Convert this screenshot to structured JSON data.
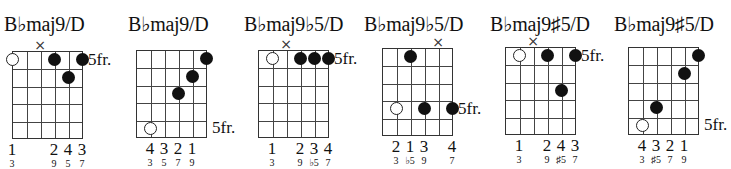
{
  "chart_data": {
    "type": "diagram",
    "chords": [
      {
        "name": "B♭maj9/D",
        "fret_label": "5fr.",
        "fret_label_row": 1,
        "muted_strings": [
          3
        ],
        "dots": [
          {
            "string": 1,
            "fret": 1,
            "open": true
          },
          {
            "string": 4,
            "fret": 1,
            "open": false
          },
          {
            "string": 6,
            "fret": 1,
            "open": false
          },
          {
            "string": 5,
            "fret": 2,
            "open": false
          }
        ],
        "fingers": [
          {
            "string": 1,
            "label": "1"
          },
          {
            "string": 4,
            "label": "2"
          },
          {
            "string": 5,
            "label": "4"
          },
          {
            "string": 6,
            "label": "3"
          }
        ],
        "intervals": [
          {
            "string": 1,
            "label": "3"
          },
          {
            "string": 4,
            "label": "9"
          },
          {
            "string": 5,
            "label": "5"
          },
          {
            "string": 6,
            "label": "7"
          }
        ]
      },
      {
        "name": "B♭maj9/D",
        "fret_label": "5fr.",
        "fret_label_row": 5,
        "muted_strings": [],
        "dots": [
          {
            "string": 6,
            "fret": 1,
            "open": false
          },
          {
            "string": 5,
            "fret": 2,
            "open": false
          },
          {
            "string": 4,
            "fret": 3,
            "open": false
          },
          {
            "string": 2,
            "fret": 5,
            "open": true
          }
        ],
        "fingers": [
          {
            "string": 2,
            "label": "4"
          },
          {
            "string": 3,
            "label": "3"
          },
          {
            "string": 4,
            "label": "2"
          },
          {
            "string": 5,
            "label": "1"
          }
        ],
        "intervals": [
          {
            "string": 2,
            "label": "3"
          },
          {
            "string": 3,
            "label": "5"
          },
          {
            "string": 4,
            "label": "7"
          },
          {
            "string": 5,
            "label": "9"
          }
        ]
      },
      {
        "name": "B♭maj9♭5/D",
        "fret_label": "5fr.",
        "fret_label_row": 1,
        "muted_strings": [
          3
        ],
        "dots": [
          {
            "string": 2,
            "fret": 1,
            "open": true
          },
          {
            "string": 4,
            "fret": 1,
            "open": false
          },
          {
            "string": 5,
            "fret": 1,
            "open": false
          },
          {
            "string": 6,
            "fret": 1,
            "open": false
          }
        ],
        "fingers": [
          {
            "string": 2,
            "label": "1"
          },
          {
            "string": 4,
            "label": "2"
          },
          {
            "string": 5,
            "label": "3"
          },
          {
            "string": 6,
            "label": "4"
          }
        ],
        "intervals": [
          {
            "string": 2,
            "label": "3"
          },
          {
            "string": 4,
            "label": "9"
          },
          {
            "string": 5,
            "label": "♭5"
          },
          {
            "string": 6,
            "label": "7"
          }
        ]
      },
      {
        "name": "B♭maj9♭5/D",
        "fret_label": "5fr.",
        "fret_label_row": 4,
        "muted_strings": [
          5
        ],
        "dots": [
          {
            "string": 3,
            "fret": 1,
            "open": false
          },
          {
            "string": 2,
            "fret": 4,
            "open": true
          },
          {
            "string": 4,
            "fret": 4,
            "open": false
          },
          {
            "string": 6,
            "fret": 4,
            "open": false
          }
        ],
        "fingers": [
          {
            "string": 2,
            "label": "2"
          },
          {
            "string": 3,
            "label": "1"
          },
          {
            "string": 4,
            "label": "3"
          },
          {
            "string": 6,
            "label": "4"
          }
        ],
        "intervals": [
          {
            "string": 2,
            "label": "3"
          },
          {
            "string": 3,
            "label": "♭5"
          },
          {
            "string": 4,
            "label": "9"
          },
          {
            "string": 6,
            "label": "7"
          }
        ]
      },
      {
        "name": "B♭maj9♯5/D",
        "fret_label": "5fr.",
        "fret_label_row": 1,
        "muted_strings": [
          3
        ],
        "dots": [
          {
            "string": 2,
            "fret": 1,
            "open": true
          },
          {
            "string": 4,
            "fret": 1,
            "open": false
          },
          {
            "string": 6,
            "fret": 1,
            "open": false
          },
          {
            "string": 5,
            "fret": 3,
            "open": false
          }
        ],
        "fingers": [
          {
            "string": 2,
            "label": "1"
          },
          {
            "string": 4,
            "label": "2"
          },
          {
            "string": 5,
            "label": "4"
          },
          {
            "string": 6,
            "label": "3"
          }
        ],
        "intervals": [
          {
            "string": 2,
            "label": "3"
          },
          {
            "string": 4,
            "label": "9"
          },
          {
            "string": 5,
            "label": "♯5"
          },
          {
            "string": 6,
            "label": "7"
          }
        ]
      },
      {
        "name": "B♭maj9♯5/D",
        "fret_label": "5fr.",
        "fret_label_row": 5,
        "muted_strings": [],
        "dots": [
          {
            "string": 6,
            "fret": 1,
            "open": false
          },
          {
            "string": 5,
            "fret": 2,
            "open": false
          },
          {
            "string": 3,
            "fret": 4,
            "open": false
          },
          {
            "string": 2,
            "fret": 5,
            "open": true
          }
        ],
        "fingers": [
          {
            "string": 2,
            "label": "4"
          },
          {
            "string": 3,
            "label": "3"
          },
          {
            "string": 4,
            "label": "2"
          },
          {
            "string": 5,
            "label": "1"
          }
        ],
        "intervals": [
          {
            "string": 2,
            "label": "3"
          },
          {
            "string": 3,
            "label": "♯5"
          },
          {
            "string": 4,
            "label": "7"
          },
          {
            "string": 5,
            "label": "9"
          }
        ]
      }
    ]
  },
  "layout": {
    "chords": [
      {
        "left": 0,
        "grid_x": 12,
        "grid_y": 51,
        "title_x": 4
      },
      {
        "left": 122,
        "grid_x": 14,
        "grid_y": 50,
        "title_x": 6
      },
      {
        "left": 244,
        "grid_x": 14,
        "grid_y": 50,
        "title_x": 0
      },
      {
        "left": 366,
        "grid_x": 16,
        "grid_y": 48,
        "title_x": -2
      },
      {
        "left": 488,
        "grid_x": 17,
        "grid_y": 47,
        "title_x": 2
      },
      {
        "left": 610,
        "grid_x": 18,
        "grid_y": 47,
        "title_x": 4
      }
    ],
    "string_gap": 14,
    "fret_gap": 17.4
  }
}
